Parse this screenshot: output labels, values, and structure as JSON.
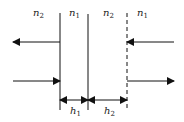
{
  "diagram": {
    "type": "multilayer interface diagram",
    "layers": [
      {
        "label": "n",
        "sub": "2"
      },
      {
        "label": "n",
        "sub": "1"
      },
      {
        "label": "n",
        "sub": "2"
      },
      {
        "label": "n",
        "sub": "1"
      }
    ],
    "thicknesses": [
      {
        "label": "h",
        "sub": "1"
      },
      {
        "label": "h",
        "sub": "2"
      }
    ],
    "interfaces": [
      "solid",
      "solid",
      "dashed"
    ],
    "colors": {
      "line": "#111111",
      "text": "#222222",
      "background": "#ffffff"
    }
  }
}
